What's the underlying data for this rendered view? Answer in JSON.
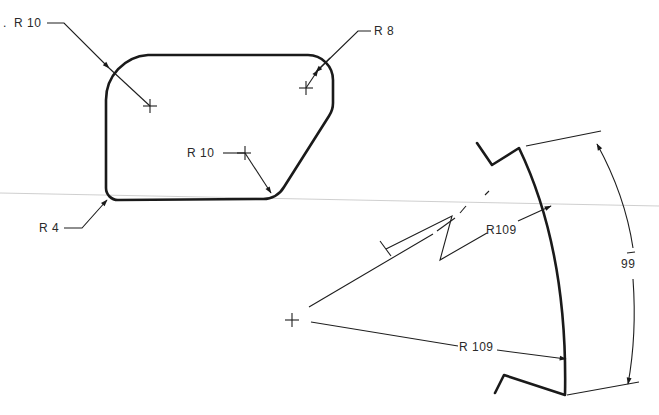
{
  "figure": {
    "background": "#ffffff",
    "line_color": "#1a1a1a",
    "scan_line_color": "#c9c9c9"
  },
  "left_part": {
    "leading_mark": ".",
    "labels": {
      "top_left_radius": "R 10",
      "top_right_radius": "R 8",
      "bottom_right_radius": "R 10",
      "bottom_left_radius": "R 4"
    }
  },
  "right_part": {
    "labels": {
      "foreshortened_radius": "R109",
      "true_radius": "R 109",
      "arc_dimension": "99"
    }
  }
}
